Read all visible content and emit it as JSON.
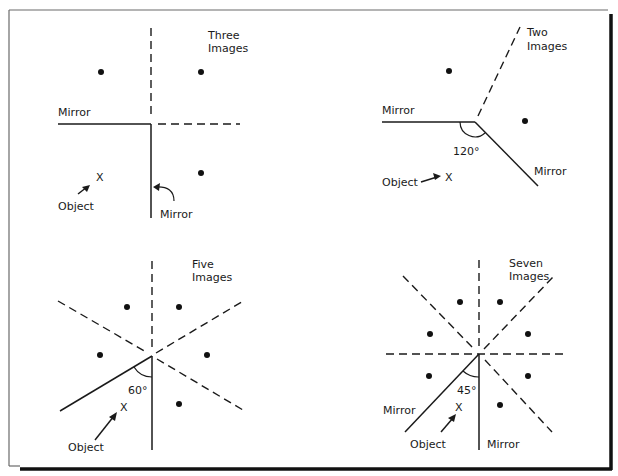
{
  "figure": {
    "panels": [
      {
        "id": "three-images",
        "caption_line1": "Three",
        "caption_line2": "Images",
        "angle_label": "",
        "mirror_label_1": "Mirror",
        "mirror_label_2": "Mirror",
        "object_label": "Object",
        "object_marker": "X",
        "vertex": [
          151,
          124
        ],
        "images": [
          [
            101,
            72
          ],
          [
            201,
            72
          ],
          [
            201,
            173
          ]
        ]
      },
      {
        "id": "two-images",
        "caption_line1": "Two",
        "caption_line2": "Images",
        "angle_label": "120°",
        "mirror_label_1": "Mirror",
        "mirror_label_2": "Mirror",
        "object_label": "Object",
        "object_marker": "X",
        "vertex": [
          475,
          122
        ],
        "images": [
          [
            449,
            71
          ],
          [
            525,
            121
          ]
        ]
      },
      {
        "id": "five-images",
        "caption_line1": "Five",
        "caption_line2": "Images",
        "angle_label": "60°",
        "mirror_label_1": "",
        "mirror_label_2": "",
        "object_label": "Object",
        "object_marker": "X",
        "vertex": [
          152,
          356
        ],
        "images": [
          [
            127,
            307
          ],
          [
            179,
            307
          ],
          [
            100,
            355
          ],
          [
            207,
            355
          ],
          [
            179,
            404
          ]
        ]
      },
      {
        "id": "seven-images",
        "caption_line1": "Seven",
        "caption_line2": "Images",
        "angle_label": "45°",
        "mirror_label_1": "Mirror",
        "mirror_label_2": "Mirror",
        "object_label": "Object",
        "object_marker": "X",
        "vertex": [
          479,
          354
        ],
        "images": [
          [
            460,
            302
          ],
          [
            500,
            302
          ],
          [
            430,
            334
          ],
          [
            528,
            334
          ],
          [
            429,
            376
          ],
          [
            528,
            376
          ],
          [
            500,
            405
          ]
        ]
      }
    ]
  }
}
